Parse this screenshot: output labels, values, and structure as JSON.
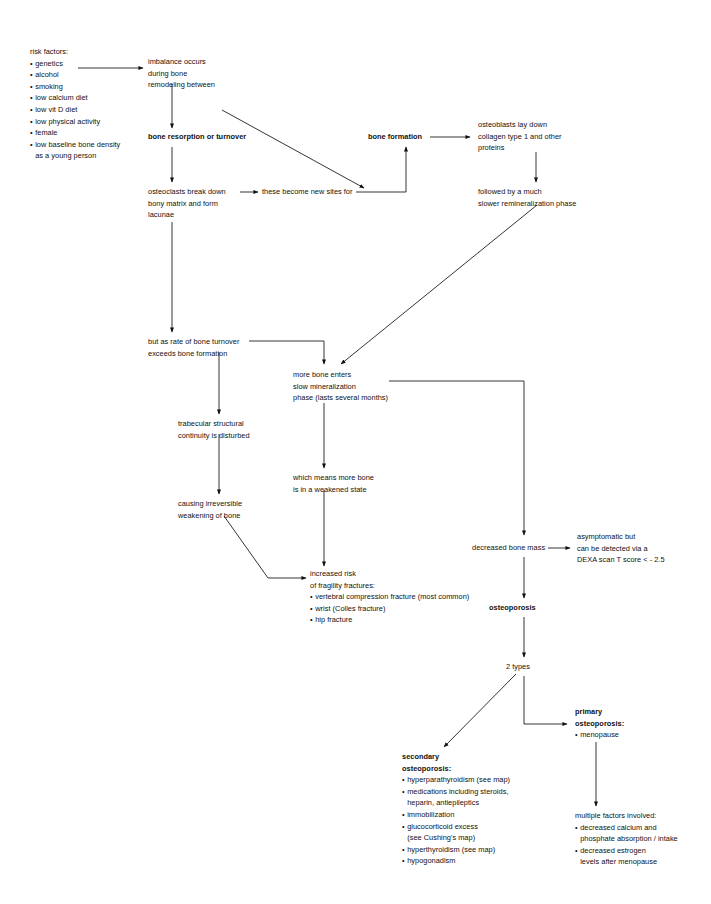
{
  "diagram": {
    "background": "#ffffff",
    "ink": "#111111"
  },
  "nodes": {
    "risk_factors": {
      "header": "risk factors:",
      "items": [
        "genetics",
        "alcohol",
        "smoking",
        "low calcium diet",
        "low vit D diet",
        "low physical activity",
        "female",
        "low baseline bone density"
      ],
      "continuation": "as a young person"
    },
    "imbalance": {
      "l1": "imbalance occurs",
      "l2": "during bone",
      "l3": "remodeling between"
    },
    "bone_resorption": {
      "l1": "bone resorption or turnover"
    },
    "bone_formation": {
      "l1": "bone formation"
    },
    "osteoblasts": {
      "l1": "osteoblasts lay down",
      "l2": "collagen type 1 and other",
      "l3": "proteins"
    },
    "osteoclasts": {
      "l1": "osteoclasts break down",
      "l2": "bony matrix and form",
      "l3": "lacunae"
    },
    "new_sites": {
      "l1": "these become new sites for"
    },
    "remineralization": {
      "l1": "followed by a much",
      "l2": "slower remineralization phase"
    },
    "turnover_exceeds": {
      "l1": "but as rate of bone turnover",
      "l2": "exceeds bone formation"
    },
    "more_bone_enters": {
      "l1": "more bone enters",
      "l2": "slow mineralization",
      "l3": "phase (lasts several months)"
    },
    "trabecular": {
      "l1": "trabecular structural",
      "l2": "continuity is disturbed"
    },
    "weakened_state": {
      "l1": "which means more bone",
      "l2": "is in a weakened state"
    },
    "causing_weakening": {
      "l1": "causing irreversible",
      "l2": "weakening of bone"
    },
    "increased_risk": {
      "l1": "increased risk",
      "l2": "of fragility fractures:",
      "items": [
        "vertebral compression fracture (most common)",
        "wrist (Colles fracture)",
        "hip fracture"
      ]
    },
    "decreased_bone_mass": {
      "l1": "decreased bone mass"
    },
    "asymptomatic": {
      "l1": "asymptomatic but",
      "l2": "can be detected via a",
      "l3": "DEXA scan T score < - 2.5"
    },
    "osteoporosis": {
      "l1": "osteoporosis"
    },
    "two_types": {
      "l1": "2 types"
    },
    "secondary": {
      "h1": "secondary",
      "h2": "osteoporosis:",
      "items": [
        "hyperparathyroidism (see map)",
        "medications including steroids,",
        "immobilization",
        "glucocorticoid excess",
        "hyperthyroidism (see map)",
        "hypogonadism"
      ],
      "cont_meds": "heparin, antiepileptics",
      "cont_gluco": "(see Cushing's map)"
    },
    "primary": {
      "h1": "primary",
      "h2": "osteoporosis:",
      "items": [
        "menopause"
      ]
    },
    "multiple_factors": {
      "h1": "multiple factors involved:",
      "items": [
        "decreased calcium and",
        "decreased estrogen"
      ],
      "cont_calcium": "phosphate absorption / intake",
      "cont_estrogen": "levels after menopause"
    }
  }
}
